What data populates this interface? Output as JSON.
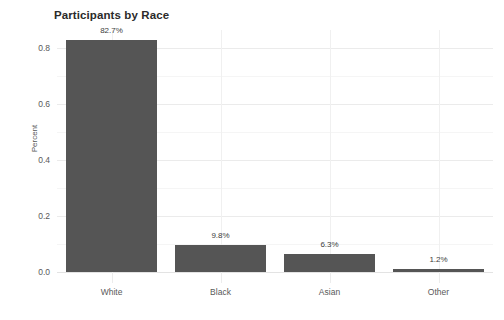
{
  "chart_data": {
    "type": "bar",
    "title": "Participants by Race",
    "xlabel": "",
    "ylabel": "Percent",
    "categories": [
      "White",
      "Black",
      "Asian",
      "Other"
    ],
    "values": [
      0.827,
      0.098,
      0.063,
      0.012
    ],
    "data_labels": [
      "82.7%",
      "9.8%",
      "6.3%",
      "1.2%"
    ],
    "ylim": [
      0.0,
      0.88
    ],
    "ytick_values": [
      0.0,
      0.2,
      0.4,
      0.6,
      0.8
    ],
    "ytick_labels": [
      "0.0",
      "0.2",
      "0.4",
      "0.6",
      "0.8"
    ],
    "yminor_tick_values": [
      0.1,
      0.3,
      0.5,
      0.7
    ],
    "grid": "horizontal-major-minor-and-vertical-category",
    "legend": "none",
    "bar_color": "#555555",
    "gridline_color": "#ebebeb",
    "minor_gridline_color": "#f5f5f5",
    "axis_color": "#e3e3e3",
    "title_color": "#2b2b2b",
    "tick_label_color": "#595959",
    "background": "#ffffff"
  }
}
